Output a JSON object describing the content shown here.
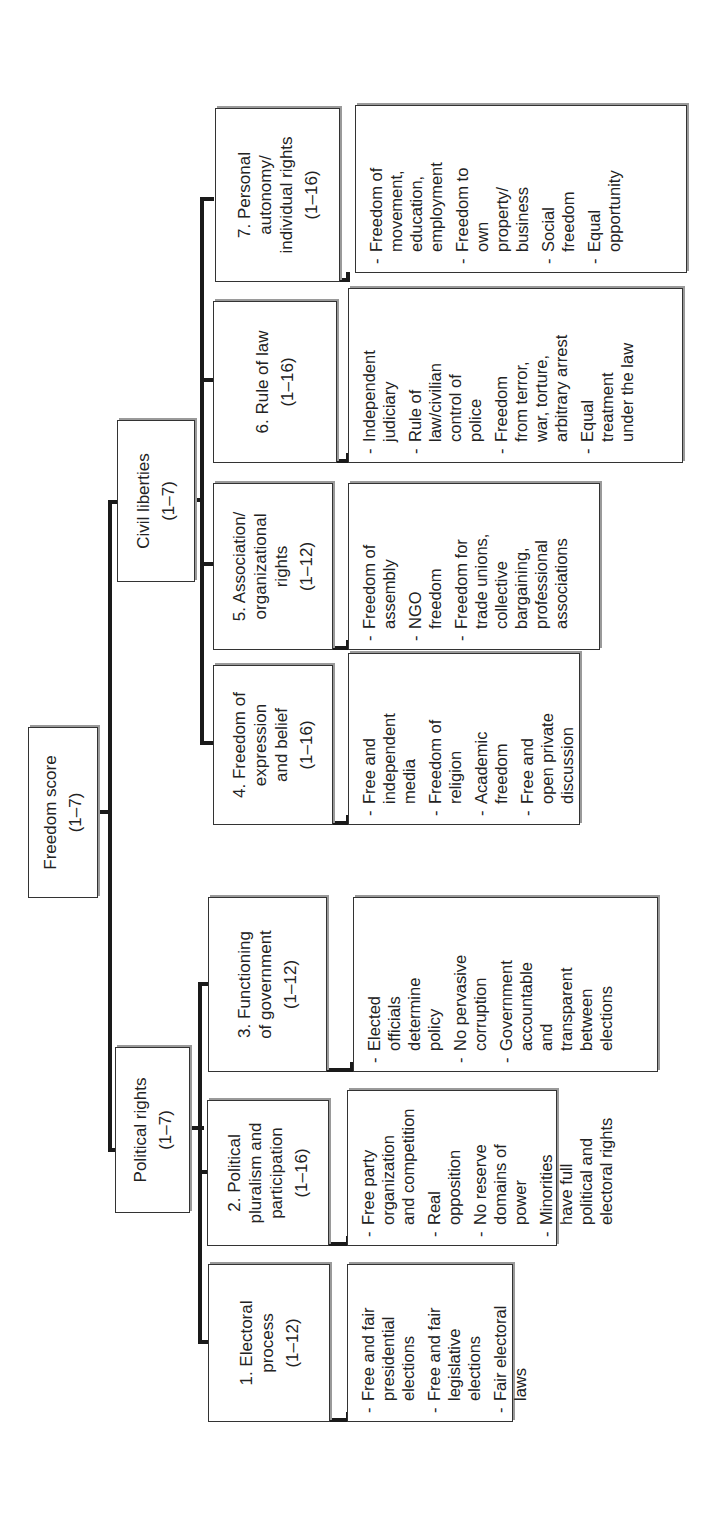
{
  "diagram": {
    "orientation": "rotated 90 degrees counter-clockwise",
    "root": {
      "title": "Freedom score",
      "range": "(1–7)"
    },
    "branches": {
      "political_rights": {
        "title": "Political rights",
        "range": "(1–7)",
        "categories": [
          {
            "title": "1. Electoral\nprocess",
            "range": "(1–12)",
            "items": [
              "Free and fair\npresidential\nelections",
              "Free and fair\nlegislative\nelections",
              "Fair electoral\nlaws"
            ]
          },
          {
            "title": "2. Political\npluralism and\nparticipation",
            "range": "(1–16)",
            "items": [
              "Free party\norganization\nand competition",
              "Real\nopposition",
              "No reserve\ndomains of\npower",
              "Minorities\nhave full\npolitical and\nelectoral rights"
            ]
          },
          {
            "title": "3. Functioning\nof government",
            "range": "(1–12)",
            "items": [
              "Elected\nofficials\ndetermine\npolicy",
              "No pervasive\ncorruption",
              "Government\naccountable\nand\ntransparent\nbetween\nelections"
            ]
          }
        ]
      },
      "civil_liberties": {
        "title": "Civil liberties",
        "range": "(1–7)",
        "categories": [
          {
            "title": "4. Freedom of\nexpression\nand belief",
            "range": "(1–16)",
            "items": [
              "Free and\nindependent\nmedia",
              "Freedom of\nreligion",
              "Academic\nfreedom",
              "Free and\nopen private\ndiscussion"
            ]
          },
          {
            "title": "5. Association/\norganizational\nrights",
            "range": "(1–12)",
            "items": [
              "Freedom of\nassembly",
              "NGO\nfreedom",
              "Freedom for\ntrade unions,\ncollective\nbargaining,\nprofessional\nassociations"
            ]
          },
          {
            "title": "6. Rule of law",
            "range": "(1–16)",
            "items": [
              "Independent\njudiciary",
              "Rule of\nlaw/civilian\ncontrol of\npolice",
              "Freedom\nfrom terror,\nwar, torture,\narbitrary arrest",
              "Equal\ntreatment\nunder the law"
            ]
          },
          {
            "title": "7. Personal\nautonomy/\nindividual rights",
            "range": "(1–16)",
            "items": [
              "Freedom of\nmovement,\neducation,\nemployment",
              "Freedom to\nown\nproperty/\nbusiness",
              "Social\nfreedom",
              "Equal\nopportunity"
            ]
          }
        ]
      }
    },
    "colors": {
      "line": "#1a1a1a",
      "border": "#333333",
      "shadow": "#9a9a9a",
      "background": "#ffffff"
    }
  }
}
